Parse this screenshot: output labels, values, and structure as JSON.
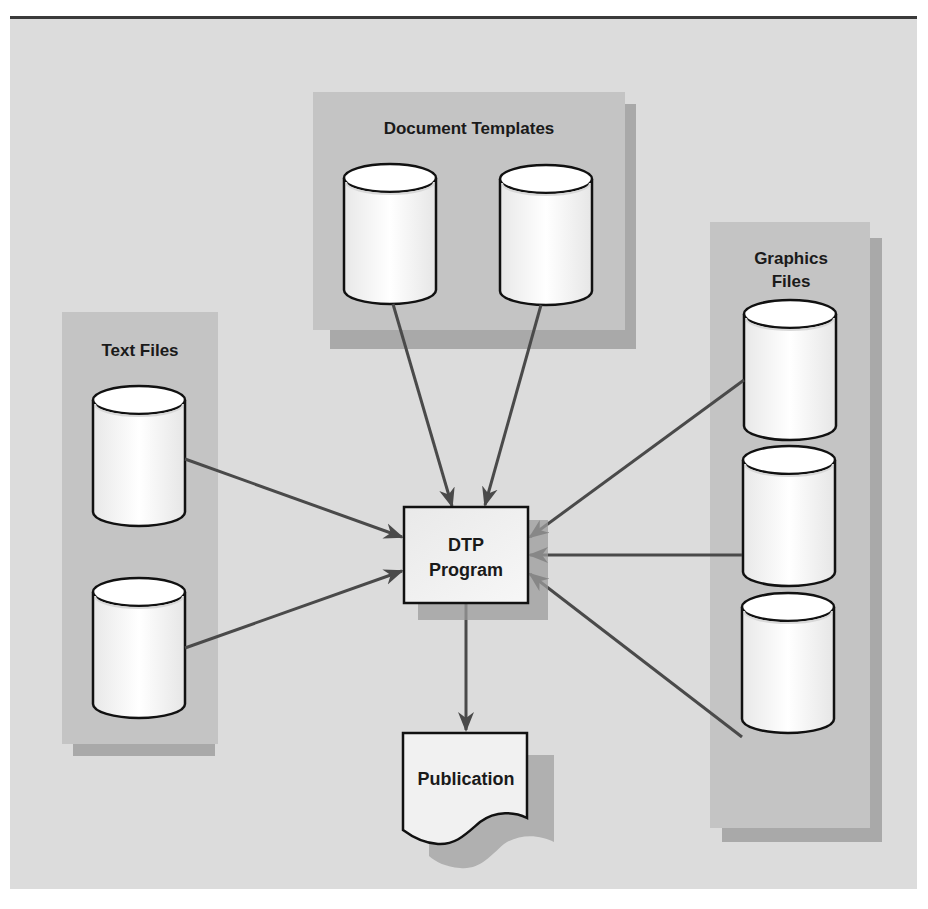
{
  "diagram": {
    "groups": {
      "document_templates": {
        "label": "Document Templates"
      },
      "text_files": {
        "label": "Text Files"
      },
      "graphics_files": {
        "label_line1": "Graphics",
        "label_line2": "Files"
      }
    },
    "center": {
      "line1": "DTP",
      "line2": "Program"
    },
    "output": {
      "label": "Publication"
    },
    "colors": {
      "background": "#dcdcdc",
      "group_fill": "#c4c4c4",
      "group_shadow": "#a9a9a9",
      "cylinder_fill": "#f4f4f4",
      "arrow": "#4a4a4a",
      "outline": "#111111"
    }
  }
}
